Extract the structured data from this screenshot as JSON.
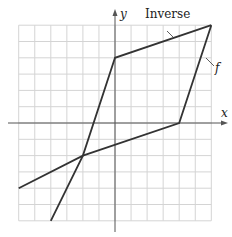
{
  "chart_data": {
    "type": "line",
    "title": "",
    "xlabel": "x",
    "ylabel": "y",
    "xlim": [
      -6,
      6
    ],
    "ylim": [
      -6,
      6
    ],
    "grid": true,
    "grid_step": 1,
    "series": [
      {
        "name": "f",
        "points": [
          [
            -6,
            -4
          ],
          [
            -2,
            -2
          ],
          [
            4,
            0
          ],
          [
            6,
            6
          ]
        ]
      },
      {
        "name": "Inverse",
        "points": [
          [
            -4,
            -6
          ],
          [
            -2,
            -2
          ],
          [
            0,
            4
          ],
          [
            6,
            6
          ]
        ]
      }
    ],
    "annotations": [
      {
        "text": "Inverse",
        "target": "Inverse"
      },
      {
        "text": "f",
        "target": "f"
      }
    ]
  },
  "labels": {
    "x_axis": "x",
    "y_axis": "y",
    "inverse": "Inverse",
    "f": "f"
  },
  "colors": {
    "grid": "#d4d4d4",
    "axis": "#555555",
    "curve": "#333333"
  }
}
